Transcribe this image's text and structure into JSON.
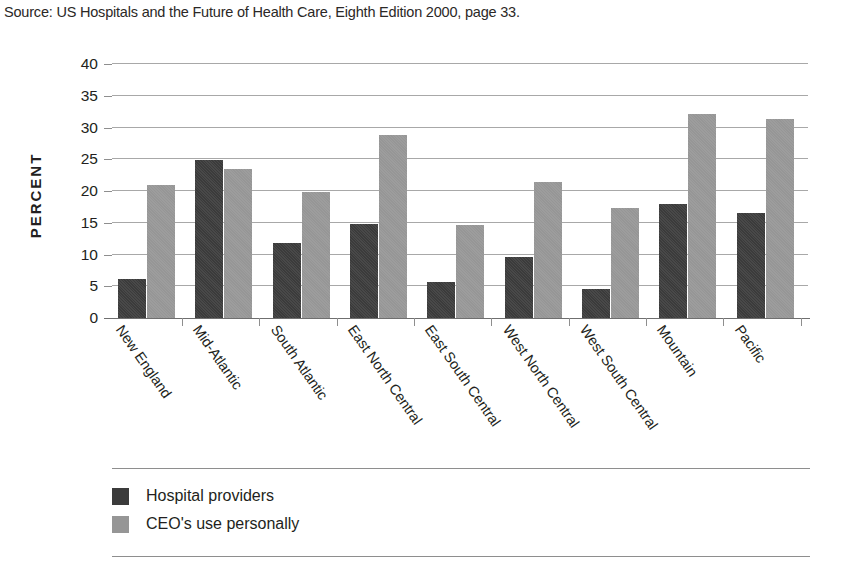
{
  "source_note": "Source: US Hospitals and the Future of Health Care, Eighth Edition 2000, page 33.",
  "colors": {
    "series_dark": "#3b3b3b",
    "series_light": "#969696",
    "gridline": "#a8a8a8",
    "text": "#231f20",
    "background": "#ffffff"
  },
  "legend": {
    "position": "bottom-left",
    "entries": [
      {
        "label": "Hospital providers",
        "swatch": "series_dark"
      },
      {
        "label": "CEO's use personally",
        "swatch": "series_light"
      }
    ]
  },
  "chart_data": {
    "type": "bar",
    "title": "",
    "subtitle": "",
    "xlabel": "",
    "ylabel": "PERCENT",
    "ylim": [
      0,
      40
    ],
    "yticks": [
      0,
      5,
      10,
      15,
      20,
      25,
      30,
      35,
      40
    ],
    "ytick_labels": [
      "0",
      "5",
      "10",
      "15",
      "20",
      "25",
      "30",
      "35",
      "40"
    ],
    "grid": "horizontal",
    "categories": [
      "New England",
      "Mid-Atlantic",
      "South Atlantic",
      "East North Central",
      "East South Central",
      "West North Central",
      "West South Central",
      "Mountain",
      "Pacific"
    ],
    "series": [
      {
        "name": "Hospital providers",
        "color": "#3b3b3b",
        "values": [
          6.2,
          24.9,
          11.8,
          14.8,
          5.7,
          9.6,
          4.6,
          18.0,
          16.5
        ]
      },
      {
        "name": "CEO's use personally",
        "color": "#969696",
        "values": [
          21.0,
          23.5,
          19.8,
          28.8,
          14.7,
          21.4,
          17.3,
          32.2,
          31.3
        ]
      }
    ],
    "annotations": []
  }
}
